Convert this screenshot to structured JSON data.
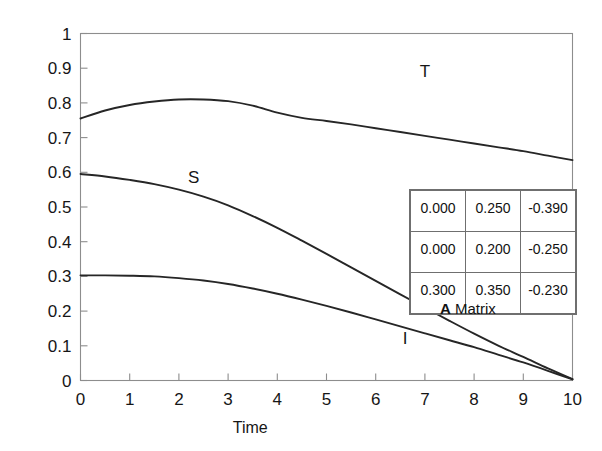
{
  "chart_data": {
    "type": "line",
    "title": "",
    "xlabel": "Time",
    "ylabel": "",
    "xlim": [
      0,
      10
    ],
    "ylim": [
      0,
      1
    ],
    "grid": false,
    "legend_position": "inline-curve-labels",
    "x_ticks": [
      "0",
      "1",
      "2",
      "3",
      "4",
      "5",
      "6",
      "7",
      "8",
      "9",
      "10"
    ],
    "y_ticks": [
      "0",
      "0.1",
      "0.2",
      "0.3",
      "0.4",
      "0.5",
      "0.6",
      "0.7",
      "0.8",
      "0.9",
      "1"
    ],
    "x": [
      0,
      0.5,
      1,
      1.5,
      2,
      2.5,
      3,
      3.5,
      4,
      4.5,
      5,
      5.5,
      6,
      6.5,
      7,
      7.5,
      8,
      8.5,
      9,
      9.5,
      10
    ],
    "series": [
      {
        "name": "T",
        "label": "T",
        "label_x": 7.0,
        "label_y": 0.875,
        "color": "#262626",
        "values": [
          0.755,
          0.778,
          0.794,
          0.804,
          0.81,
          0.81,
          0.805,
          0.792,
          0.772,
          0.757,
          0.748,
          0.738,
          0.727,
          0.716,
          0.705,
          0.694,
          0.683,
          0.672,
          0.661,
          0.648,
          0.635
        ]
      },
      {
        "name": "S",
        "label": "S",
        "label_x": 2.3,
        "label_y": 0.568,
        "color": "#262626",
        "values": [
          0.595,
          0.588,
          0.578,
          0.566,
          0.55,
          0.53,
          0.505,
          0.474,
          0.44,
          0.403,
          0.365,
          0.326,
          0.287,
          0.248,
          0.21,
          0.172,
          0.135,
          0.1,
          0.068,
          0.035,
          0.004
        ]
      },
      {
        "name": "I",
        "label": "I",
        "label_x": 6.6,
        "label_y": 0.105,
        "color": "#262626",
        "values": [
          0.303,
          0.303,
          0.302,
          0.3,
          0.295,
          0.288,
          0.278,
          0.265,
          0.25,
          0.233,
          0.215,
          0.196,
          0.176,
          0.156,
          0.136,
          0.116,
          0.096,
          0.074,
          0.052,
          0.028,
          0.003
        ]
      }
    ],
    "annotations": {
      "matrix": {
        "caption_bold": "A",
        "caption_rest": " Matrix",
        "rows": [
          [
            "0.000",
            "0.250",
            "-0.390"
          ],
          [
            "0.000",
            "0.200",
            "-0.250"
          ],
          [
            "0.300",
            "0.350",
            "-0.230"
          ]
        ]
      }
    }
  }
}
